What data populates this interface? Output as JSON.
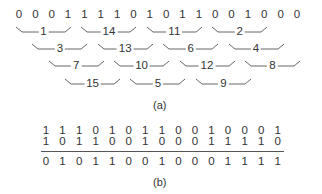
{
  "part_a": {
    "caption": "(a)",
    "bits": [
      "0",
      "0",
      "0",
      "1",
      "1",
      "1",
      "1",
      "0",
      "1",
      "0",
      "1",
      "1",
      "0",
      "0",
      "1",
      "0",
      "0",
      "0"
    ],
    "bracket_rows": [
      [
        {
          "label": "1",
          "start": 0
        },
        {
          "label": "14",
          "start": 4
        },
        {
          "label": "11",
          "start": 8
        },
        {
          "label": "2",
          "start": 12
        }
      ],
      [
        {
          "label": "3",
          "start": 1
        },
        {
          "label": "13",
          "start": 5
        },
        {
          "label": "6",
          "start": 9
        },
        {
          "label": "4",
          "start": 13
        }
      ],
      [
        {
          "label": "7",
          "start": 2
        },
        {
          "label": "10",
          "start": 6
        },
        {
          "label": "12",
          "start": 10
        },
        {
          "label": "8",
          "start": 14
        }
      ],
      [
        {
          "label": "15",
          "start": 3
        },
        {
          "label": "5",
          "start": 7
        },
        {
          "label": "9",
          "start": 11
        }
      ]
    ]
  },
  "part_b": {
    "caption": "(b)",
    "row1": [
      "1",
      "1",
      "1",
      "0",
      "1",
      "0",
      "1",
      "1",
      "0",
      "0",
      "1",
      "0",
      "0",
      "0",
      "1"
    ],
    "row2": [
      "1",
      "0",
      "1",
      "1",
      "0",
      "0",
      "1",
      "0",
      "0",
      "0",
      "1",
      "1",
      "1",
      "1",
      "0"
    ],
    "result": [
      "0",
      "1",
      "0",
      "1",
      "1",
      "0",
      "0",
      "1",
      "0",
      "0",
      "0",
      "1",
      "1",
      "1",
      "1"
    ]
  }
}
